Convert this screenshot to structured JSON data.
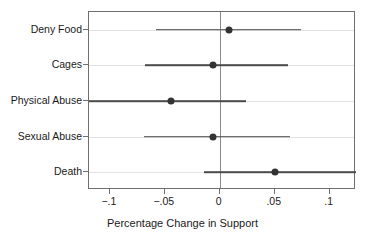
{
  "chart_data": {
    "type": "scatter",
    "subtype": "coefficient-plot-with-confidence-intervals",
    "title": "",
    "xlabel": "Percentage Change in Support",
    "ylabel": "",
    "orientation": "horizontal",
    "grid": "horizontal-category-gridlines",
    "legend": "none",
    "zero_reference_line": 0,
    "xlim": [
      -0.119,
      0.124
    ],
    "xticks": [
      -0.1,
      -0.05,
      0,
      0.05,
      0.1
    ],
    "xticklabels": [
      "−.1",
      "−.05",
      "0",
      ".05",
      ".1"
    ],
    "categories": [
      "Deny Food",
      "Cages",
      "Physical Abuse",
      "Sexual Abuse",
      "Death"
    ],
    "values": [
      0.008,
      -0.006,
      -0.044,
      -0.006,
      0.05
    ],
    "ci_low": [
      -0.058,
      -0.068,
      -0.119,
      -0.069,
      -0.014
    ],
    "ci_high": [
      0.074,
      0.062,
      0.024,
      0.064,
      0.124
    ],
    "points": [
      {
        "label": "Deny Food",
        "estimate": 0.008,
        "ci_low": -0.058,
        "ci_high": 0.074,
        "ci_low_clipped": false,
        "ci_high_clipped": false
      },
      {
        "label": "Cages",
        "estimate": -0.006,
        "ci_low": -0.068,
        "ci_high": 0.062,
        "ci_low_clipped": false,
        "ci_high_clipped": false
      },
      {
        "label": "Physical Abuse",
        "estimate": -0.044,
        "ci_low": -0.119,
        "ci_high": 0.024,
        "ci_low_clipped": true,
        "ci_high_clipped": false
      },
      {
        "label": "Sexual Abuse",
        "estimate": -0.006,
        "ci_low": -0.069,
        "ci_high": 0.064,
        "ci_low_clipped": false,
        "ci_high_clipped": false
      },
      {
        "label": "Death",
        "estimate": 0.05,
        "ci_low": -0.014,
        "ci_high": 0.124,
        "ci_low_clipped": false,
        "ci_high_clipped": true
      }
    ],
    "colors": {
      "marker": "#333333",
      "interval": "#4a4a4a",
      "gridline": "#e2e2e2",
      "frame": "#6e6e6e",
      "zero_line": "#8a8a8a",
      "background": "#ffffff",
      "text": "#1a1a1a"
    }
  }
}
